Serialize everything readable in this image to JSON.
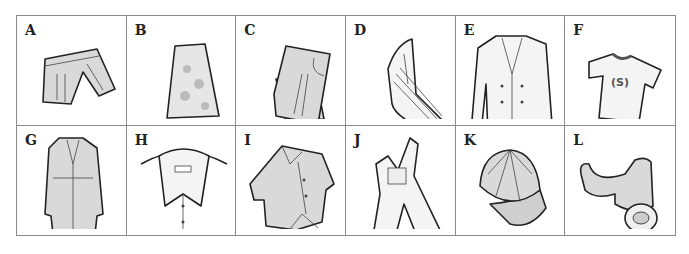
{
  "items": [
    {
      "letter": "A",
      "name": "shorts"
    },
    {
      "letter": "B",
      "name": "skirt"
    },
    {
      "letter": "C",
      "name": "jeans"
    },
    {
      "letter": "D",
      "name": "striped shirt sleeve"
    },
    {
      "letter": "E",
      "name": "double-breasted jacket"
    },
    {
      "letter": "F",
      "name": "t-shirt",
      "print": "(S)"
    },
    {
      "letter": "G",
      "name": "trench coat"
    },
    {
      "letter": "H",
      "name": "button-down collar shirt"
    },
    {
      "letter": "I",
      "name": "tie-front blouse"
    },
    {
      "letter": "J",
      "name": "overalls"
    },
    {
      "letter": "K",
      "name": "baseball cap"
    },
    {
      "letter": "L",
      "name": "belt"
    }
  ]
}
